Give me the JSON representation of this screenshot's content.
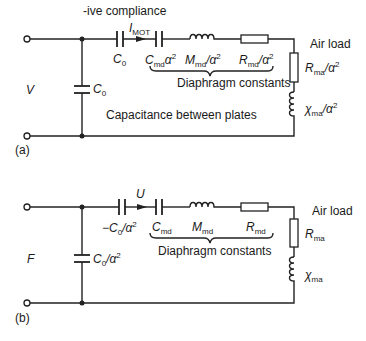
{
  "diagram_a": {
    "tag": "(a)",
    "top_annotation": "-ive compliance",
    "input_label": "V",
    "current_label": "I",
    "current_sub": "MOT",
    "series_cap_label": "C",
    "series_cap_sub": "0",
    "shunt_cap_label": "C",
    "shunt_cap_sub": "0",
    "cmd_label": "C",
    "cmd_sub": "md",
    "cmd_suffix": "α",
    "mmd_label": "M",
    "mmd_sub": "md",
    "mmd_suffix": "/α",
    "rmd_label": "R",
    "rmd_sub": "md",
    "rmd_suffix": "/α",
    "rma_label": "R",
    "rma_sub": "ma",
    "rma_suffix": "/α",
    "xma_label": "χ",
    "xma_sub": "ma",
    "xma_suffix": "/α",
    "sq": "2",
    "brace_label": "Diaphragm constants",
    "air_load_label": "Air load",
    "plates_label": "Capacitance between plates"
  },
  "diagram_b": {
    "tag": "(b)",
    "input_label": "F",
    "current_label": "U",
    "series_cap_label": "−C",
    "series_cap_sub": "0",
    "series_cap_suffix": "/α",
    "shunt_cap_label": "C",
    "shunt_cap_sub": "0",
    "shunt_cap_suffix": "/α",
    "cmd_label": "C",
    "cmd_sub": "md",
    "mmd_label": "M",
    "mmd_sub": "md",
    "rmd_label": "R",
    "rmd_sub": "md",
    "rma_label": "R",
    "rma_sub": "ma",
    "xma_label": "χ",
    "xma_sub": "ma",
    "sq": "2",
    "brace_label": "Diaphragm constants",
    "air_load_label": "Air load"
  }
}
